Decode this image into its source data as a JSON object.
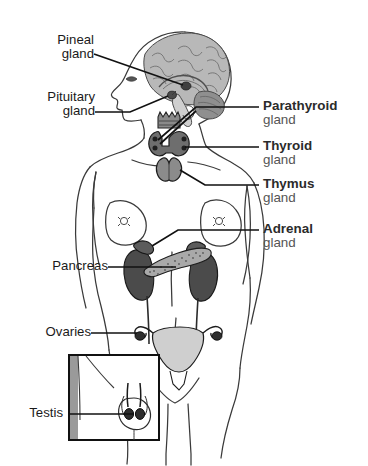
{
  "figure": {
    "kind": "anatomical-diagram",
    "background_color": "#ffffff",
    "outline_color": "#3a3a3a",
    "leader_line_color": "#111111",
    "label_bold_color": "#2b2b2b",
    "label_light_color": "#555555",
    "label_left_color": "#1a1a1a"
  },
  "labels": {
    "left": [
      {
        "name": "pineal-gland",
        "word1": "Pineal",
        "word2": "gland"
      },
      {
        "name": "pituitary-gland",
        "word1": "Pituitary",
        "word2": "gland"
      },
      {
        "name": "pancreas",
        "word1": "Pancreas",
        "word2": ""
      },
      {
        "name": "ovaries",
        "word1": "Ovaries",
        "word2": ""
      },
      {
        "name": "testis",
        "word1": "Testis",
        "word2": ""
      }
    ],
    "right": [
      {
        "name": "parathyroid-gland",
        "word1": "Parathyroid",
        "word2": "gland"
      },
      {
        "name": "thyroid-gland",
        "word1": "Thyroid",
        "word2": "gland"
      },
      {
        "name": "thymus-gland",
        "word1": "Thymus",
        "word2": "gland"
      },
      {
        "name": "adrenal-gland",
        "word1": "Adrenal",
        "word2": "gland"
      }
    ]
  },
  "organs": {
    "brain": {
      "name": "brain-sagittal-section",
      "fill": "#b8b8b8"
    },
    "cerebellum": {
      "name": "cerebellum",
      "fill": "#8f8f8f"
    },
    "pineal": {
      "name": "pineal-gland-organ",
      "fill": "#3f3f3f"
    },
    "pituitary": {
      "name": "pituitary-gland-organ",
      "fill": "#4a4a4a"
    },
    "larynx": {
      "name": "larynx",
      "fill": "#8a8a8a"
    },
    "thyroid": {
      "name": "thyroid-gland-organ",
      "fill": "#6e6e6e"
    },
    "thymus": {
      "name": "thymus-gland-organ",
      "fill": "#8b8b8b"
    },
    "kidney_left": {
      "name": "kidney-left",
      "fill": "#4b4b4b"
    },
    "kidney_right": {
      "name": "kidney-right",
      "fill": "#4b4b4b"
    },
    "adrenal_left": {
      "name": "adrenal-gland-left",
      "fill": "#5c5c5c"
    },
    "adrenal_right": {
      "name": "adrenal-gland-right",
      "fill": "#5c5c5c"
    },
    "pancreas": {
      "name": "pancreas-organ",
      "fill": "#a9a9a9"
    },
    "uterus": {
      "name": "uterus",
      "fill": "#cfcfcf"
    },
    "ovary_left": {
      "name": "ovary-left",
      "fill": "#2e2e2e"
    },
    "ovary_right": {
      "name": "ovary-right",
      "fill": "#2e2e2e"
    },
    "testes": {
      "name": "testes-organ",
      "fill": "#2e2e2e"
    },
    "inset_box": {
      "name": "testis-inset-box",
      "border": "#111111"
    }
  }
}
